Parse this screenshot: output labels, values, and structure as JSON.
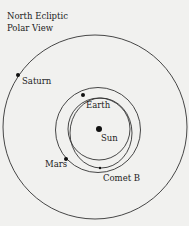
{
  "title": {
    "line1": "North Ecliptic",
    "line2": "Polar View"
  },
  "labels": {
    "saturn": "Saturn",
    "earth": "Earth",
    "sun": "Sun",
    "mars": "Mars",
    "comet": "Comet B"
  },
  "colors": {
    "background": "#f1f1ef",
    "line": "#333333",
    "text": "#222222"
  }
}
